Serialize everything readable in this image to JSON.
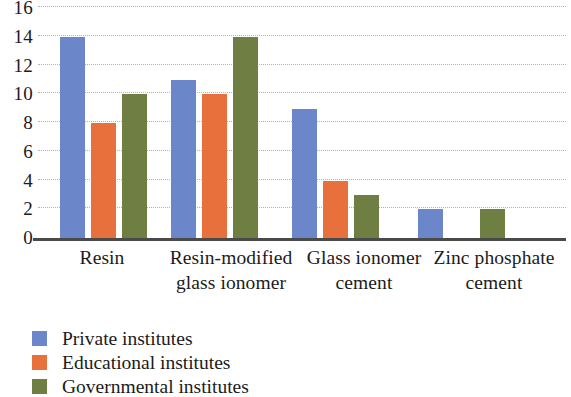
{
  "chart_data": {
    "type": "bar",
    "title": "",
    "subtitle": "",
    "xlabel": "",
    "ylabel": "",
    "ylim": [
      0,
      16
    ],
    "ytick_step": 2,
    "yticks": [
      "16",
      "14",
      "12",
      "10",
      "8",
      "6",
      "4",
      "2",
      "0"
    ],
    "grid": true,
    "grid_style": "dotted-horizontal",
    "legend_position": "bottom-left",
    "categories": [
      "Resin",
      "Resin-modified glass ionomer",
      "Glass ionomer cement",
      "Zinc phosphate cement"
    ],
    "category_lines": [
      [
        "Resin"
      ],
      [
        "Resin-modified",
        "glass ionomer"
      ],
      [
        "Glass ionomer",
        "cement"
      ],
      [
        "Zinc phosphate",
        "cement"
      ]
    ],
    "series": [
      {
        "name": "Private institutes",
        "color": "#6b86c9",
        "values": [
          14,
          11,
          9,
          2
        ]
      },
      {
        "name": "Educational institutes",
        "color": "#e8703c",
        "values": [
          8,
          10,
          4,
          0
        ]
      },
      {
        "name": "Governmental institutes",
        "color": "#6f7e42",
        "values": [
          10,
          14,
          3,
          2
        ]
      }
    ]
  },
  "legend": {
    "items": [
      {
        "label": "Private institutes"
      },
      {
        "label": "Educational institutes"
      },
      {
        "label": "Governmental institutes"
      }
    ]
  },
  "axis": {
    "baseline_color": "#4a4a4a",
    "gridline_color": "#a8a8a8",
    "text_color": "#1b1b1b"
  }
}
